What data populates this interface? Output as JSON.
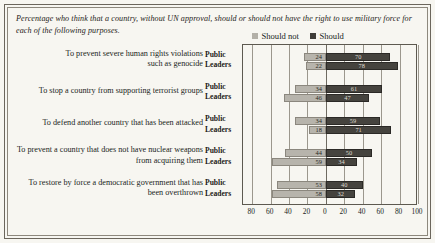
{
  "caption": "Percentage who think that a country, without UN approval, should or should not have the right to use military force for each of the following purposes.",
  "legend": {
    "items": [
      {
        "label": "Should not",
        "color": "#b3b0a8",
        "icon": "square-swatch-icon"
      },
      {
        "label": "Should",
        "color": "#3f3d39",
        "icon": "square-swatch-icon"
      }
    ]
  },
  "series_labels": {
    "public": "Public",
    "leaders": "Leaders"
  },
  "axis": {
    "tick_labels": [
      "80",
      "60",
      "40",
      "20",
      "0",
      "20",
      "40",
      "60",
      "80",
      "100"
    ],
    "tick_positions": [
      -80,
      -60,
      -40,
      -20,
      0,
      20,
      40,
      60,
      80,
      100
    ]
  },
  "chart_data": {
    "type": "bar",
    "subtype": "diverging-grouped-horizontal",
    "title": "Percentage who think that a country, without UN approval, should or should not have the right to use military force for each of the following purposes.",
    "xlabel": "",
    "ylabel": "",
    "xlim": [
      -90,
      100
    ],
    "grid": true,
    "legend_position": "top-center",
    "categories": [
      "To prevent severe human rights violations such as genocide",
      "To stop a country from supporting terrorist groups",
      "To defend another country that has been attacked",
      "To prevent a country that does not have nuclear weapons from acquiring them",
      "To restore by force a democratic government that has been overthrown"
    ],
    "category_lines": [
      [
        "To prevent severe human rights violations",
        "such as genocide"
      ],
      [
        "To stop a country from supporting terrorist groups"
      ],
      [
        "To defend another country that has been attacked"
      ],
      [
        "To prevent a country that does not have nuclear weapons",
        "from acquiring them"
      ],
      [
        "To restore by force a democratic government that has",
        "been overthrown"
      ]
    ],
    "respondent_groups": [
      "Public",
      "Leaders"
    ],
    "series": [
      {
        "name": "Should not",
        "color": "#b3b0a8",
        "direction": "left",
        "values": {
          "Public": [
            24,
            34,
            34,
            44,
            53
          ],
          "Leaders": [
            22,
            46,
            18,
            59,
            58
          ]
        }
      },
      {
        "name": "Should",
        "color": "#3f3d39",
        "direction": "right",
        "values": {
          "Public": [
            70,
            61,
            59,
            50,
            40
          ],
          "Leaders": [
            78,
            47,
            71,
            34,
            32
          ]
        }
      }
    ]
  }
}
